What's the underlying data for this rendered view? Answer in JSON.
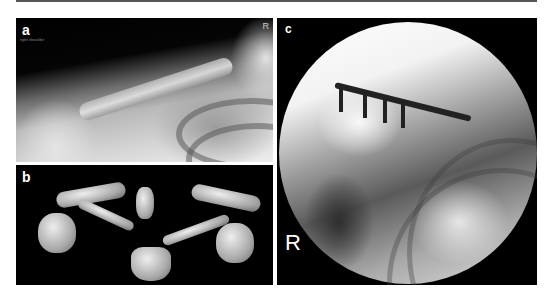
{
  "figure": {
    "panels": [
      {
        "id": "a",
        "label": "a",
        "description": "Plain radiograph of the right shoulder showing a lateral clavicle fracture",
        "corner_marker": "R",
        "caption_text": "right shoulder"
      },
      {
        "id": "b",
        "label": "b",
        "description": "3D CT volume rendering of the shoulder girdle (clavicles, sternum, vertebra, scapulae)"
      },
      {
        "id": "c",
        "label": "c",
        "description": "Intraoperative fluoroscopy showing plate and screw fixation of the clavicle",
        "side_marker": "R"
      }
    ]
  }
}
